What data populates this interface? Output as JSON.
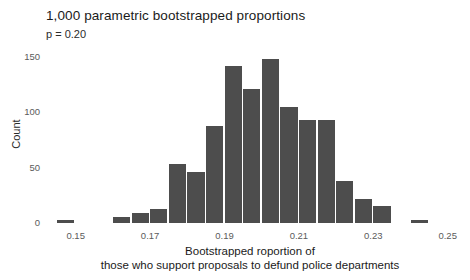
{
  "chart_data": {
    "type": "bar",
    "title": "1,000 parametric bootstrapped proportions",
    "subtitle": "p = 0.20",
    "xlabel_line1": "Bootstrapped roportion of",
    "xlabel_line2": "those who support proposals to defund police departments",
    "ylabel": "Count",
    "bar_color": "#4d4d4d",
    "background_color": "#ffffff",
    "grid": false,
    "legend": "none",
    "bin_width": 0.005,
    "xlim": [
      0.1425,
      0.2565
    ],
    "ylim": [
      0,
      160
    ],
    "xticks": [
      0.15,
      0.17,
      0.19,
      0.21,
      0.23,
      0.25
    ],
    "xtick_labels": [
      "0.15",
      "0.17",
      "0.19",
      "0.21",
      "0.23",
      "0.25"
    ],
    "yticks": [
      0,
      50,
      100,
      150
    ],
    "ytick_labels": [
      "0",
      "50",
      "100",
      "150"
    ],
    "categories": [
      0.1475,
      0.1525,
      0.1575,
      0.1625,
      0.1675,
      0.1725,
      0.1775,
      0.1825,
      0.1875,
      0.1925,
      0.1975,
      0.2025,
      0.2075,
      0.2125,
      0.2175,
      0.2225,
      0.2275,
      0.2325,
      0.2375,
      0.2425
    ],
    "values": [
      2,
      0,
      0,
      5,
      9,
      13,
      53,
      46,
      88,
      142,
      121,
      148,
      105,
      93,
      93,
      38,
      22,
      15,
      0,
      2
    ]
  }
}
